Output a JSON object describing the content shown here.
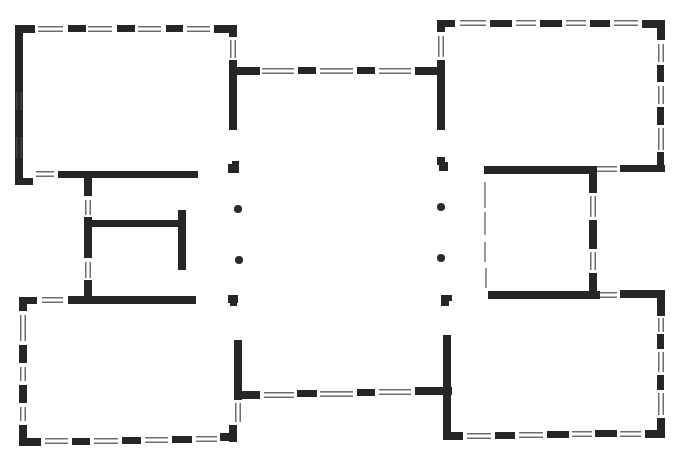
{
  "diagram": {
    "type": "architectural-floor-plan",
    "title": "",
    "canvas": {
      "width": 675,
      "height": 463
    },
    "colors": {
      "wall": "#262626",
      "window": "#4a4a4a",
      "background": "#ffffff"
    },
    "legend": {
      "solid_bar": "wall segment",
      "double_line": "window opening",
      "dot": "column",
      "thin_line": "light partition"
    },
    "walls": [
      [
        15,
        25,
        8,
        145
      ],
      [
        15,
        25,
        20,
        8
      ],
      [
        68,
        25,
        18,
        7
      ],
      [
        117,
        25,
        18,
        7
      ],
      [
        166,
        25,
        17,
        7
      ],
      [
        214,
        25,
        23,
        8
      ],
      [
        229,
        25,
        8,
        12
      ],
      [
        15,
        170,
        8,
        11
      ],
      [
        15,
        178,
        18,
        7
      ],
      [
        58,
        171,
        140,
        7
      ],
      [
        84,
        171,
        8,
        25
      ],
      [
        229,
        60,
        8,
        70
      ],
      [
        237,
        67,
        23,
        8
      ],
      [
        298,
        67,
        18,
        7
      ],
      [
        357,
        67,
        18,
        7
      ],
      [
        415,
        67,
        23,
        8
      ],
      [
        437,
        60,
        8,
        70
      ],
      [
        437,
        20,
        8,
        12
      ],
      [
        437,
        20,
        18,
        7
      ],
      [
        490,
        20,
        22,
        7
      ],
      [
        540,
        20,
        22,
        7
      ],
      [
        590,
        20,
        20,
        7
      ],
      [
        642,
        20,
        22,
        8
      ],
      [
        657,
        20,
        8,
        20
      ],
      [
        657,
        65,
        7,
        17
      ],
      [
        657,
        107,
        7,
        18
      ],
      [
        657,
        152,
        7,
        20
      ],
      [
        620,
        165,
        45,
        7
      ],
      [
        484,
        166,
        107,
        8
      ],
      [
        589,
        166,
        8,
        27
      ],
      [
        589,
        220,
        8,
        29
      ],
      [
        589,
        273,
        8,
        24
      ],
      [
        488,
        291,
        112,
        8
      ],
      [
        620,
        290,
        44,
        8
      ],
      [
        657,
        290,
        8,
        26
      ],
      [
        657,
        334,
        7,
        15
      ],
      [
        657,
        375,
        7,
        15
      ],
      [
        657,
        418,
        8,
        20
      ],
      [
        645,
        430,
        20,
        8
      ],
      [
        595,
        430,
        22,
        7
      ],
      [
        547,
        431,
        22,
        7
      ],
      [
        495,
        432,
        20,
        7
      ],
      [
        443,
        432,
        20,
        8
      ],
      [
        443,
        335,
        8,
        105
      ],
      [
        437,
        387,
        15,
        8
      ],
      [
        415,
        387,
        28,
        8
      ],
      [
        357,
        389,
        18,
        7
      ],
      [
        297,
        390,
        20,
        7
      ],
      [
        237,
        391,
        23,
        8
      ],
      [
        234,
        340,
        8,
        60
      ],
      [
        229,
        425,
        8,
        17
      ],
      [
        220,
        433,
        17,
        8
      ],
      [
        172,
        436,
        20,
        7
      ],
      [
        122,
        437,
        19,
        7
      ],
      [
        72,
        438,
        18,
        7
      ],
      [
        19,
        438,
        22,
        8
      ],
      [
        19,
        425,
        8,
        20
      ],
      [
        19,
        385,
        8,
        18
      ],
      [
        19,
        345,
        8,
        18
      ],
      [
        19,
        297,
        8,
        14
      ],
      [
        19,
        297,
        18,
        7
      ],
      [
        68,
        296,
        128,
        8
      ],
      [
        84,
        280,
        8,
        24
      ],
      [
        84,
        217,
        8,
        41
      ],
      [
        84,
        220,
        100,
        7
      ],
      [
        178,
        210,
        8,
        60
      ],
      [
        15,
        90,
        8,
        34
      ],
      [
        228,
        164,
        11,
        9
      ],
      [
        232,
        161,
        7,
        7
      ],
      [
        228,
        295,
        10,
        8
      ],
      [
        230,
        295,
        7,
        11
      ],
      [
        439,
        162,
        9,
        9
      ],
      [
        437,
        157,
        8,
        8
      ],
      [
        441,
        296,
        8,
        10
      ],
      [
        441,
        295,
        11,
        6
      ]
    ],
    "windows": [
      {
        "x1": 38,
        "y1": 29,
        "x2": 63,
        "y2": 29,
        "orient": "h"
      },
      {
        "x1": 88,
        "y1": 29,
        "x2": 112,
        "y2": 29,
        "orient": "h"
      },
      {
        "x1": 138,
        "y1": 29,
        "x2": 161,
        "y2": 29,
        "orient": "h"
      },
      {
        "x1": 187,
        "y1": 29,
        "x2": 210,
        "y2": 29,
        "orient": "h"
      },
      {
        "x1": 233,
        "y1": 40,
        "x2": 233,
        "y2": 58,
        "orient": "v"
      },
      {
        "x1": 19,
        "y1": 92,
        "x2": 19,
        "y2": 110,
        "orient": "v"
      },
      {
        "x1": 19,
        "y1": 137,
        "x2": 19,
        "y2": 158,
        "orient": "v"
      },
      {
        "x1": 36,
        "y1": 174,
        "x2": 54,
        "y2": 174,
        "orient": "h"
      },
      {
        "x1": 88,
        "y1": 200,
        "x2": 88,
        "y2": 215,
        "orient": "v"
      },
      {
        "x1": 88,
        "y1": 262,
        "x2": 88,
        "y2": 278,
        "orient": "v"
      },
      {
        "x1": 262,
        "y1": 71,
        "x2": 294,
        "y2": 71,
        "orient": "h"
      },
      {
        "x1": 320,
        "y1": 71,
        "x2": 353,
        "y2": 71,
        "orient": "h"
      },
      {
        "x1": 379,
        "y1": 71,
        "x2": 411,
        "y2": 71,
        "orient": "h"
      },
      {
        "x1": 441,
        "y1": 36,
        "x2": 441,
        "y2": 57,
        "orient": "v"
      },
      {
        "x1": 460,
        "y1": 23,
        "x2": 486,
        "y2": 23,
        "orient": "h"
      },
      {
        "x1": 516,
        "y1": 23,
        "x2": 536,
        "y2": 23,
        "orient": "h"
      },
      {
        "x1": 566,
        "y1": 23,
        "x2": 586,
        "y2": 23,
        "orient": "h"
      },
      {
        "x1": 614,
        "y1": 23,
        "x2": 638,
        "y2": 23,
        "orient": "h"
      },
      {
        "x1": 661,
        "y1": 44,
        "x2": 661,
        "y2": 62,
        "orient": "v"
      },
      {
        "x1": 661,
        "y1": 86,
        "x2": 661,
        "y2": 104,
        "orient": "v"
      },
      {
        "x1": 661,
        "y1": 128,
        "x2": 661,
        "y2": 150,
        "orient": "v"
      },
      {
        "x1": 597,
        "y1": 169,
        "x2": 617,
        "y2": 169,
        "orient": "h"
      },
      {
        "x1": 593,
        "y1": 196,
        "x2": 593,
        "y2": 217,
        "orient": "v"
      },
      {
        "x1": 593,
        "y1": 252,
        "x2": 593,
        "y2": 270,
        "orient": "v"
      },
      {
        "x1": 600,
        "y1": 295,
        "x2": 617,
        "y2": 295,
        "orient": "h"
      },
      {
        "x1": 661,
        "y1": 318,
        "x2": 661,
        "y2": 332,
        "orient": "v"
      },
      {
        "x1": 661,
        "y1": 352,
        "x2": 661,
        "y2": 372,
        "orient": "v"
      },
      {
        "x1": 661,
        "y1": 393,
        "x2": 661,
        "y2": 415,
        "orient": "v"
      },
      {
        "x1": 620,
        "y1": 434,
        "x2": 641,
        "y2": 434,
        "orient": "h"
      },
      {
        "x1": 572,
        "y1": 434,
        "x2": 592,
        "y2": 434,
        "orient": "h"
      },
      {
        "x1": 519,
        "y1": 435,
        "x2": 543,
        "y2": 435,
        "orient": "h"
      },
      {
        "x1": 467,
        "y1": 436,
        "x2": 491,
        "y2": 436,
        "orient": "h"
      },
      {
        "x1": 264,
        "y1": 395,
        "x2": 294,
        "y2": 395,
        "orient": "h"
      },
      {
        "x1": 320,
        "y1": 394,
        "x2": 353,
        "y2": 394,
        "orient": "h"
      },
      {
        "x1": 379,
        "y1": 392,
        "x2": 411,
        "y2": 392,
        "orient": "h"
      },
      {
        "x1": 238,
        "y1": 403,
        "x2": 238,
        "y2": 422,
        "orient": "v"
      },
      {
        "x1": 196,
        "y1": 439,
        "x2": 217,
        "y2": 439,
        "orient": "h"
      },
      {
        "x1": 145,
        "y1": 440,
        "x2": 168,
        "y2": 440,
        "orient": "h"
      },
      {
        "x1": 94,
        "y1": 441,
        "x2": 118,
        "y2": 441,
        "orient": "h"
      },
      {
        "x1": 45,
        "y1": 441,
        "x2": 68,
        "y2": 441,
        "orient": "h"
      },
      {
        "x1": 23,
        "y1": 407,
        "x2": 23,
        "y2": 421,
        "orient": "v"
      },
      {
        "x1": 23,
        "y1": 367,
        "x2": 23,
        "y2": 381,
        "orient": "v"
      },
      {
        "x1": 23,
        "y1": 315,
        "x2": 23,
        "y2": 341,
        "orient": "v"
      },
      {
        "x1": 42,
        "y1": 300,
        "x2": 63,
        "y2": 300,
        "orient": "h"
      }
    ],
    "thin_lines": [
      {
        "x1": 485,
        "y1": 182,
        "x2": 485,
        "y2": 208
      },
      {
        "x1": 485,
        "y1": 212,
        "x2": 485,
        "y2": 235
      },
      {
        "x1": 485,
        "y1": 242,
        "x2": 485,
        "y2": 262
      },
      {
        "x1": 486,
        "y1": 268,
        "x2": 486,
        "y2": 288
      }
    ],
    "columns": [
      {
        "cx": 238,
        "cy": 209,
        "r": 4
      },
      {
        "cx": 239,
        "cy": 260,
        "r": 4
      },
      {
        "cx": 441,
        "cy": 207,
        "r": 4
      },
      {
        "cx": 441,
        "cy": 258,
        "r": 4
      }
    ],
    "rooms": [
      {
        "name": "room-top-left"
      },
      {
        "name": "room-top-right"
      },
      {
        "name": "room-bottom-left"
      },
      {
        "name": "room-bottom-right"
      },
      {
        "name": "room-middle-left"
      },
      {
        "name": "room-middle-right"
      },
      {
        "name": "central-hall"
      }
    ]
  }
}
